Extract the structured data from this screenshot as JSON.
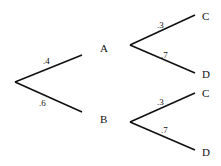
{
  "diagram": {
    "type": "probability-tree",
    "root": {
      "branches": [
        {
          "prob_label": ".4",
          "node": "A",
          "children": [
            {
              "prob_label": ".3",
              "node": "C"
            },
            {
              "prob_label": ".7",
              "node": "D"
            }
          ]
        },
        {
          "prob_label": ".6",
          "node": "B",
          "children": [
            {
              "prob_label": ".3",
              "node": "C"
            },
            {
              "prob_label": ".7",
              "node": "D"
            }
          ]
        }
      ]
    },
    "line_color": "#111111"
  }
}
